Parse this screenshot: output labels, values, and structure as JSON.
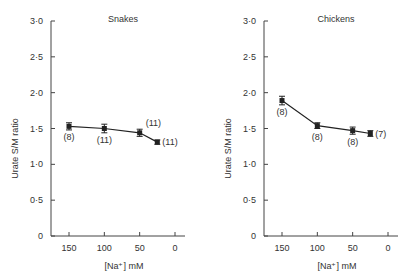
{
  "chart_data": [
    {
      "type": "line",
      "title": "Snakes",
      "xlabel": "[Na⁺] mM",
      "ylabel": "Urate S/M ratio",
      "xlim": [
        175,
        -8
      ],
      "ylim": [
        0,
        3.0
      ],
      "xticks": [
        150,
        100,
        50,
        0
      ],
      "xtick_labels": [
        "150",
        "100",
        "50",
        "0"
      ],
      "yticks": [
        0,
        0.5,
        1.0,
        1.5,
        2.0,
        2.5,
        3.0
      ],
      "ytick_labels": [
        "0",
        "0·5",
        "1·0",
        "1·5",
        "2·0",
        "2·5",
        "3·0"
      ],
      "grid": false,
      "series": [
        {
          "name": "Snakes",
          "x": [
            150,
            100,
            50,
            25
          ],
          "y": [
            1.53,
            1.5,
            1.44,
            1.31
          ],
          "err": [
            0.05,
            0.06,
            0.05,
            0.03
          ],
          "n_labels": [
            "(8)",
            "(11)",
            "(11)",
            "(11)"
          ],
          "n_label_pos": [
            "below",
            "below",
            "above-right",
            "right"
          ]
        }
      ]
    },
    {
      "type": "line",
      "title": "Chickens",
      "xlabel": "[Na⁺] mM",
      "ylabel": "Urate S/M ratio",
      "xlim": [
        175,
        -8
      ],
      "ylim": [
        0,
        3.0
      ],
      "xticks": [
        150,
        100,
        50,
        0
      ],
      "xtick_labels": [
        "150",
        "100",
        "50",
        "0"
      ],
      "yticks": [
        0,
        0.5,
        1.0,
        1.5,
        2.0,
        2.5,
        3.0
      ],
      "ytick_labels": [
        "0",
        "0·5",
        "1·0",
        "1·5",
        "2·0",
        "2·5",
        "3·0"
      ],
      "grid": false,
      "series": [
        {
          "name": "Chickens",
          "x": [
            150,
            100,
            50,
            25
          ],
          "y": [
            1.89,
            1.54,
            1.47,
            1.43
          ],
          "err": [
            0.06,
            0.04,
            0.05,
            0.04
          ],
          "n_labels": [
            "(8)",
            "(8)",
            "(8)",
            "(7)"
          ],
          "n_label_pos": [
            "below",
            "below",
            "below",
            "right"
          ]
        }
      ]
    }
  ]
}
